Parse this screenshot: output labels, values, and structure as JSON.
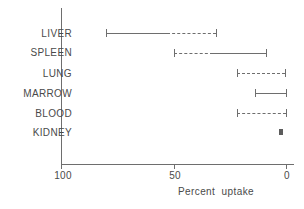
{
  "chart_data": {
    "type": "bar",
    "title": "",
    "subtitle": "",
    "xlabel": "Percent  uptake",
    "ylabel": "",
    "xlim": [
      100,
      0
    ],
    "ylim": [
      0,
      6
    ],
    "grid": false,
    "legend": null,
    "orientation": "horizontal",
    "x_axis": {
      "ticks": [
        100,
        50,
        0
      ],
      "tick_labels": [
        "100",
        "50",
        "0"
      ],
      "direction": "reversed",
      "line_start_value": 100,
      "line_end_value": -3.5
    },
    "categories": [
      "LIVER",
      "SPLEEN",
      "LUNG",
      "MARROW",
      "BLOOD",
      "KIDNEY"
    ],
    "rows": [
      {
        "category": "LIVER",
        "range_start": 80.0,
        "range_end": 31.0,
        "caps": [
          80.0,
          31.0
        ],
        "segments": [
          {
            "from": 80.0,
            "to": 53.0,
            "style": "solid"
          },
          {
            "from": 53.0,
            "to": 31.0,
            "style": "dashed"
          }
        ]
      },
      {
        "category": "SPLEEN",
        "range_start": 50.0,
        "range_end": 9.0,
        "caps": [
          50.0,
          9.0
        ],
        "segments": [
          {
            "from": 50.0,
            "to": 32.5,
            "style": "dashed"
          },
          {
            "from": 32.5,
            "to": 9.0,
            "style": "solid"
          }
        ]
      },
      {
        "category": "LUNG",
        "range_start": 22.0,
        "range_end": 0.5,
        "caps": [
          22.0,
          0.5
        ],
        "segments": [
          {
            "from": 22.0,
            "to": 0.5,
            "style": "dashed"
          }
        ]
      },
      {
        "category": "MARROW",
        "range_start": 14.0,
        "range_end": 0.0,
        "caps": [
          14.0,
          0.0
        ],
        "segments": [
          {
            "from": 14.0,
            "to": 0.0,
            "style": "solid"
          }
        ]
      },
      {
        "category": "BLOOD",
        "range_start": 22.0,
        "range_end": 0.0,
        "caps": [
          22.0,
          0.0
        ],
        "segments": [
          {
            "from": 22.0,
            "to": 0.0,
            "style": "dashed"
          }
        ]
      },
      {
        "category": "KIDNEY",
        "range_start": 3.0,
        "range_end": 1.5,
        "caps": [],
        "segments": [
          {
            "from": 3.0,
            "to": 1.5,
            "style": "solid"
          }
        ],
        "marker": "thick-point"
      }
    ],
    "colors": {
      "line": "#6e6e6e",
      "text": "#4a4a4a",
      "background": "#ffffff"
    }
  }
}
